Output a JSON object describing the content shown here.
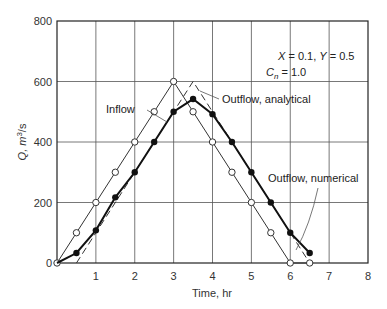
{
  "chart_data": {
    "type": "line",
    "title": "",
    "xlabel": "Time, hr",
    "ylabel": "Q, m³/s",
    "xlim": [
      0,
      8
    ],
    "ylim": [
      0,
      800
    ],
    "xticks": [
      1,
      2,
      3,
      4,
      5,
      6,
      7,
      8
    ],
    "yticks": [
      0,
      200,
      400,
      600,
      800
    ],
    "grid": true,
    "parameters_text": {
      "line1": "X = 0.1, Y = 0.5",
      "line2": "Cn = 1.0"
    },
    "series": [
      {
        "name": "Inflow",
        "marker": "open-circle",
        "line_style": "solid-thin",
        "x": [
          0,
          0.5,
          1,
          1.5,
          2,
          2.5,
          3,
          3.5,
          4,
          4.5,
          5,
          5.5,
          6,
          6.5
        ],
        "y": [
          0,
          100,
          200,
          300,
          400,
          500,
          600,
          500,
          400,
          300,
          200,
          100,
          0,
          0
        ]
      },
      {
        "name": "Outflow, analytical",
        "marker": "none",
        "line_style": "dashed",
        "x": [
          0.5,
          3.5,
          6.5
        ],
        "y": [
          0,
          600,
          0
        ]
      },
      {
        "name": "Outflow, numerical",
        "marker": "filled-circle",
        "line_style": "solid-thick",
        "x": [
          0,
          0.5,
          1,
          1.5,
          2,
          2.5,
          3,
          3.5,
          4,
          4.5,
          5,
          5.5,
          6,
          6.5
        ],
        "y": [
          0,
          33,
          108,
          217,
          300,
          400,
          500,
          542,
          492,
          400,
          300,
          200,
          100,
          33
        ]
      }
    ],
    "annotations": [
      {
        "text": "Inflow",
        "x": 1.05,
        "y": 450
      },
      {
        "text": "Outflow, analytical",
        "x": 3.95,
        "y": 575
      },
      {
        "text": "Outflow, numerical",
        "x": 5.5,
        "y": 400
      }
    ]
  },
  "labels": {
    "y_axis_title_prefix": "Q, m",
    "y_axis_title_sup": "3",
    "y_axis_title_suffix": "/s",
    "x_axis_title": "Time, hr",
    "param_x_label": "X",
    "param_x_value": " = 0.1, ",
    "param_y_label": "Y",
    "param_y_value": " = 0.5",
    "param_c_label": "C",
    "param_c_sub": "n",
    "param_c_value": " = 1.0",
    "inflow_label": "Inflow",
    "analytical_label": "Outflow, analytical",
    "numerical_label": "Outflow, numerical"
  }
}
